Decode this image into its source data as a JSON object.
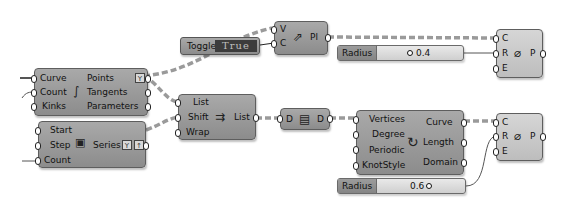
{
  "canvas": {
    "background": "#ffffff",
    "component_color": "#9a9a9a",
    "wire_color": "#8a8a8a"
  },
  "components": {
    "divide_curve": {
      "inputs": [
        "Curve",
        "Count",
        "Kinks"
      ],
      "outputs": [
        "Points",
        "Tangents",
        "Parameters"
      ],
      "icon": "divide-curve-icon",
      "flag": "Y"
    },
    "series": {
      "inputs": [
        "Start",
        "Step",
        "Count"
      ],
      "output": "Series",
      "icon": "series-icon",
      "flags": [
        "Y",
        "↑"
      ]
    },
    "toggle": {
      "name": "Toggle",
      "value": "True"
    },
    "pick": {
      "inputs": [
        "V",
        "C"
      ],
      "output": "Pl",
      "icon": "pick-icon"
    },
    "shift_list": {
      "inputs": [
        "List",
        "Shift",
        "Wrap"
      ],
      "output": "List",
      "icon": "shift-list-icon"
    },
    "data": {
      "input": "D",
      "output": "D",
      "icon": "data-icon"
    },
    "pipe_top": {
      "inputs": [
        "C",
        "R",
        "E"
      ],
      "output": "P",
      "icon": "pipe-icon"
    },
    "nurbs_curve": {
      "inputs": [
        "Vertices",
        "Degree",
        "Periodic",
        "KnotStyle"
      ],
      "outputs": [
        "Curve",
        "Length",
        "Domain"
      ],
      "icon": "nurbs-curve-icon"
    },
    "pipe_bottom": {
      "inputs": [
        "C",
        "R",
        "E"
      ],
      "output": "P",
      "icon": "pipe-icon"
    },
    "slider_top": {
      "name": "Radius",
      "value": "0.4"
    },
    "slider_bottom": {
      "name": "Radius",
      "value": "0.6"
    }
  }
}
